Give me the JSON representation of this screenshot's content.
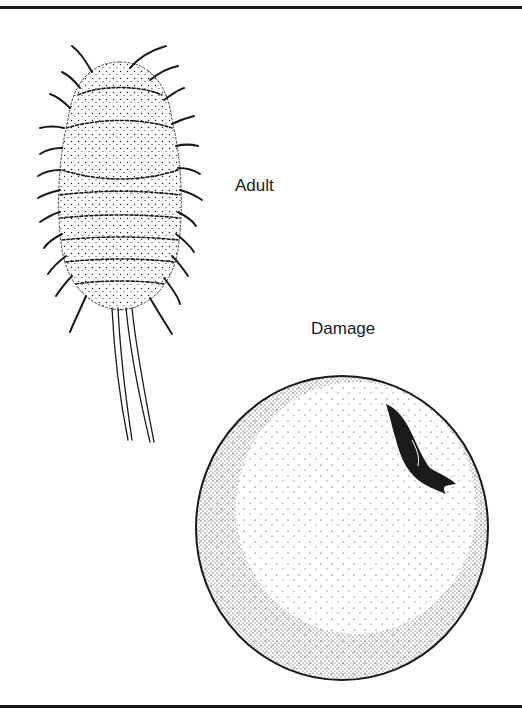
{
  "figure": {
    "labels": {
      "adult": "Adult",
      "damage": "Damage"
    },
    "subjects": [
      {
        "id": "adult",
        "description": "mealybug adult, dorsal view, segmented stippled body with lateral wax filaments and two long caudal filaments"
      },
      {
        "id": "damage",
        "description": "round fruit with dark irregular lesion near upper right"
      }
    ],
    "colors": {
      "ink": "#1a1a1a",
      "paper": "#ffffff"
    }
  }
}
